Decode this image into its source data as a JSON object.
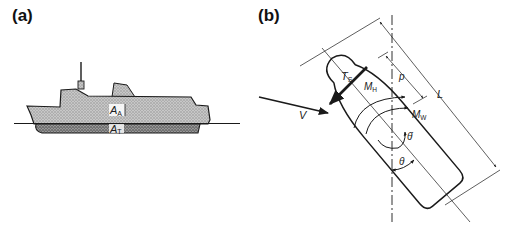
{
  "panels": {
    "a": {
      "label": "(a)",
      "above_water_area_label": "A",
      "above_water_area_sub": "A",
      "underwater_area_label": "A",
      "underwater_area_sub": "T"
    },
    "b": {
      "label": "(b)",
      "wind_velocity": "V",
      "side_thrust": "T",
      "side_thrust_sub": "S",
      "hydro_moment": "M",
      "hydro_moment_sub": "H",
      "wind_moment": "M",
      "wind_moment_sub": "W",
      "lever_arm": "p",
      "ship_length": "L",
      "yaw_rate": "θ̇",
      "heading_angle": "θ"
    }
  },
  "colors": {
    "ink": "#1a1a1a",
    "hull_above": "#bdbdbd",
    "hull_below": "#8a8a8a",
    "background": "#ffffff"
  }
}
